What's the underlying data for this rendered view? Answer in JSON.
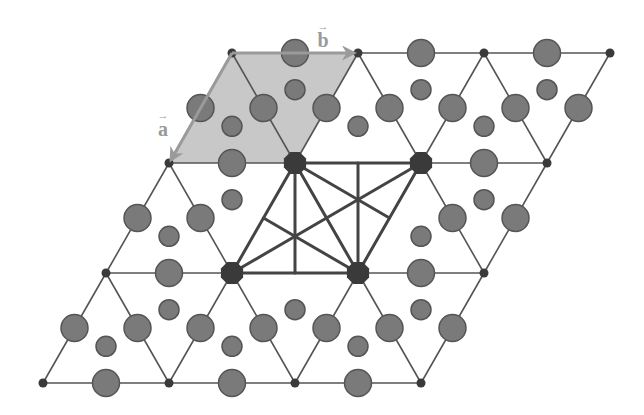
{
  "diagram": {
    "width": 644,
    "height": 415,
    "colors": {
      "background": "#ffffff",
      "lattice_line": "#555555",
      "thick_line": "#444444",
      "unit_cell_fill": "#c8c8c8",
      "atom_fill": "#7a7a7a",
      "atom_stroke": "#555555",
      "node_fill": "#3a3a3a",
      "big_node_fill": "#3a3a3a",
      "vector_color": "#9a9a9a"
    },
    "sizes": {
      "lattice_line_width": 1.6,
      "thick_line_width": 3,
      "big_atom_radius": 13.5,
      "small_atom_radius": 10,
      "node_radius": 4.5,
      "big_node_radius": 12,
      "vector_width": 3
    },
    "lattice": {
      "rows": [
        {
          "y": 53,
          "x": [
            232,
            358,
            484,
            610
          ]
        },
        {
          "y": 163,
          "x": [
            169,
            295,
            421,
            547
          ]
        },
        {
          "y": 273,
          "x": [
            106,
            232,
            358,
            484
          ]
        },
        {
          "y": 383,
          "x": [
            43,
            169,
            295,
            421
          ]
        }
      ]
    },
    "unit_cell": {
      "label": "primitive unit cell",
      "points": [
        [
          232,
          53
        ],
        [
          358,
          53
        ],
        [
          295,
          163
        ],
        [
          169,
          163
        ]
      ]
    },
    "vectors": [
      {
        "name": "a",
        "letter": "a",
        "arrow": "→",
        "from": [
          232,
          53
        ],
        "to": [
          171,
          160
        ],
        "label_pos": [
          163,
          127
        ]
      },
      {
        "name": "b",
        "letter": "b",
        "arrow": "→",
        "from": [
          232,
          53
        ],
        "to": [
          354,
          53
        ],
        "label_pos": [
          323,
          38
        ]
      }
    ],
    "big_nodes": [
      [
        295,
        163
      ],
      [
        421,
        163
      ],
      [
        232,
        273
      ],
      [
        358,
        273
      ]
    ],
    "supercell_lines": [
      [
        [
          295,
          163
        ],
        [
          421,
          163
        ]
      ],
      [
        [
          421,
          163
        ],
        [
          358,
          273
        ]
      ],
      [
        [
          358,
          273
        ],
        [
          232,
          273
        ]
      ],
      [
        [
          232,
          273
        ],
        [
          295,
          163
        ]
      ],
      [
        [
          295,
          163
        ],
        [
          358,
          273
        ]
      ],
      [
        [
          232,
          273
        ],
        [
          421,
          163
        ]
      ],
      [
        [
          295,
          163
        ],
        [
          295,
          273
        ]
      ],
      [
        [
          358,
          163
        ],
        [
          358,
          273
        ]
      ],
      [
        [
          295,
          163
        ],
        [
          389.5,
          218
        ]
      ],
      [
        [
          263.5,
          218
        ],
        [
          358,
          273
        ]
      ]
    ],
    "big_atoms": [
      [
        295,
        53
      ],
      [
        421,
        53
      ],
      [
        547,
        53
      ],
      [
        232,
        163
      ],
      [
        484,
        163
      ],
      [
        169,
        273
      ],
      [
        421,
        273
      ],
      [
        106,
        383
      ],
      [
        232,
        383
      ],
      [
        358,
        383
      ],
      [
        200.5,
        108
      ],
      [
        326.5,
        108
      ],
      [
        452.5,
        108
      ],
      [
        578.5,
        108
      ],
      [
        263.5,
        108
      ],
      [
        389.5,
        108
      ],
      [
        515.5,
        108
      ],
      [
        137.5,
        218
      ],
      [
        515.5,
        218
      ],
      [
        200.5,
        218
      ],
      [
        452.5,
        218
      ],
      [
        74.5,
        328
      ],
      [
        200.5,
        328
      ],
      [
        326.5,
        328
      ],
      [
        452.5,
        328
      ],
      [
        137.5,
        328
      ],
      [
        263.5,
        328
      ],
      [
        389.5,
        328
      ]
    ],
    "small_atoms": [
      [
        295,
        89.7
      ],
      [
        421,
        89.7
      ],
      [
        547,
        89.7
      ],
      [
        232,
        126.3
      ],
      [
        358,
        126.3
      ],
      [
        484,
        126.3
      ],
      [
        232,
        199.7
      ],
      [
        484,
        199.7
      ],
      [
        169,
        236.3
      ],
      [
        421,
        236.3
      ],
      [
        169,
        309.7
      ],
      [
        295,
        309.7
      ],
      [
        421,
        309.7
      ],
      [
        106,
        346.3
      ],
      [
        232,
        346.3
      ],
      [
        358,
        346.3
      ]
    ]
  }
}
